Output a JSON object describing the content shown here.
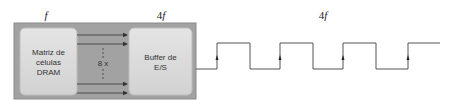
{
  "labels": {
    "dram_freq": "f",
    "buffer_freq_prefix": "4",
    "buffer_freq_var": "f",
    "wave_freq_prefix": "4",
    "wave_freq_var": "f"
  },
  "blocks": {
    "dram": {
      "line1": "Matriz de",
      "line2": "células",
      "line3": "DRAM"
    },
    "buffer": {
      "line1": "Buffer de",
      "line2": "E/S"
    },
    "bus_label": "8 x"
  },
  "colors": {
    "outer_box": "#9e9e9e",
    "inner_box": "#d9d9d9",
    "line": "#555555"
  }
}
